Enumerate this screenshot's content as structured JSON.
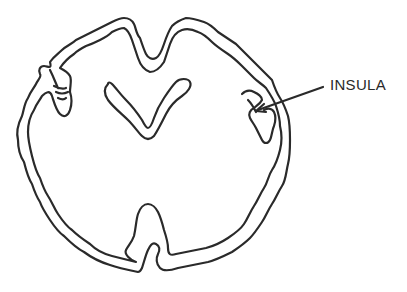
{
  "figure": {
    "labels": [
      {
        "id": "insula",
        "text": "INSULA",
        "x": 330,
        "y": 76
      }
    ],
    "structures": [
      "outer-cortex-outline",
      "inner-cortex-outline",
      "lateral-ventricles",
      "insula-fold-left",
      "insula-fold-right",
      "longitudinal-fissure-bottom"
    ],
    "colors": {
      "line": "#2a2a2a",
      "background": "#ffffff"
    }
  }
}
